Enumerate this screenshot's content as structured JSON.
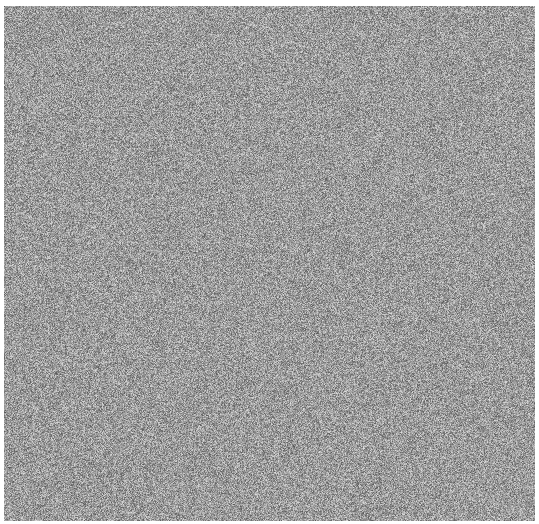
{
  "image": {
    "width": 539,
    "height": 524,
    "description": "Uniform gray random-noise texture with no readable UI elements",
    "background_color": "#ffffff",
    "noise": {
      "region": {
        "left": 4,
        "top": 6,
        "width": 531,
        "height": 515
      },
      "mean_gray": 155,
      "spread": 70,
      "colors": {
        "base": "#9a9a9a",
        "light": "#d8d8d8",
        "dark": "#5a5a5a"
      }
    }
  }
}
